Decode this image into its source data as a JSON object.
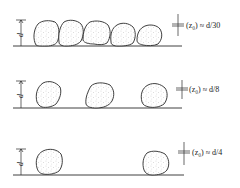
{
  "diagram": {
    "element_dimension_label": "d",
    "rows": [
      {
        "id": "dense",
        "label": "⟨z₀⟩ ≈ d/30",
        "z0_label_text": "(z₀) ≈ d/30",
        "pebble_count": 5,
        "spacing": "touching"
      },
      {
        "id": "medium",
        "label": "⟨z₀⟩ ≈ d/8",
        "z0_label_text": "(z₀) ≈ d/8",
        "pebble_count": 3,
        "spacing": "moderate"
      },
      {
        "id": "sparse",
        "label": "⟨z₀⟩ ≈ d/4",
        "z0_label_text": "(z₀) ≈ d/4",
        "pebble_count": 2,
        "spacing": "wide"
      }
    ],
    "colors": {
      "line": "#2a2a2a",
      "background": "#ffffff",
      "stipple": "#777777"
    }
  }
}
